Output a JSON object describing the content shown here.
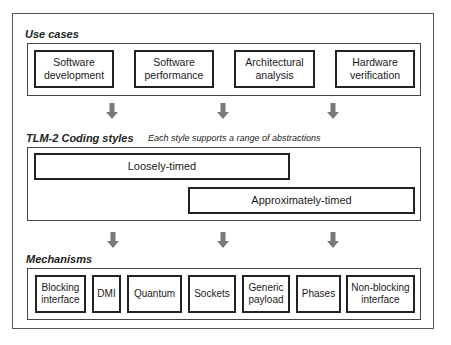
{
  "use_cases": {
    "title": "Use cases",
    "items": [
      {
        "label": "Software development"
      },
      {
        "label": "Software performance"
      },
      {
        "label": "Architectural analysis"
      },
      {
        "label": "Hardware verification"
      }
    ]
  },
  "coding_styles": {
    "title": "TLM-2 Coding styles",
    "subtitle": "Each style supports a range of abstractions",
    "items": [
      {
        "label": "Loosely-timed"
      },
      {
        "label": "Approximately-timed"
      }
    ]
  },
  "mechanisms": {
    "title": "Mechanisms",
    "items": [
      {
        "label": "Blocking interface"
      },
      {
        "label": "DMI"
      },
      {
        "label": "Quantum"
      },
      {
        "label": "Sockets"
      },
      {
        "label": "Generic payload"
      },
      {
        "label": "Phases"
      },
      {
        "label": "Non-blocking interface"
      }
    ]
  },
  "arrows": {
    "color": "#7a7a7a",
    "count_per_row": 3
  },
  "colors": {
    "border": "#222222",
    "outer_border": "#555555",
    "background": "#ffffff"
  }
}
